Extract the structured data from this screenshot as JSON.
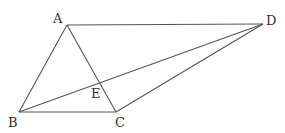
{
  "diagram": {
    "type": "geometry",
    "points": {
      "A": {
        "label": "A",
        "x": 67,
        "y": 25,
        "lx": 53,
        "ly": 23
      },
      "B": {
        "label": "B",
        "x": 19,
        "y": 112,
        "lx": 8,
        "ly": 127
      },
      "C": {
        "label": "C",
        "x": 116,
        "y": 112,
        "lx": 115,
        "ly": 127
      },
      "D": {
        "label": "D",
        "x": 263,
        "y": 24,
        "lx": 266,
        "ly": 25
      },
      "E": {
        "label": "E",
        "x": 100,
        "y": 84,
        "lx": 91,
        "ly": 98
      }
    },
    "segments": [
      {
        "from": "A",
        "to": "D"
      },
      {
        "from": "A",
        "to": "B"
      },
      {
        "from": "A",
        "to": "C"
      },
      {
        "from": "B",
        "to": "C"
      },
      {
        "from": "B",
        "to": "D"
      },
      {
        "from": "C",
        "to": "D"
      }
    ],
    "stroke_color": "#555555",
    "label_color": "#333333"
  }
}
